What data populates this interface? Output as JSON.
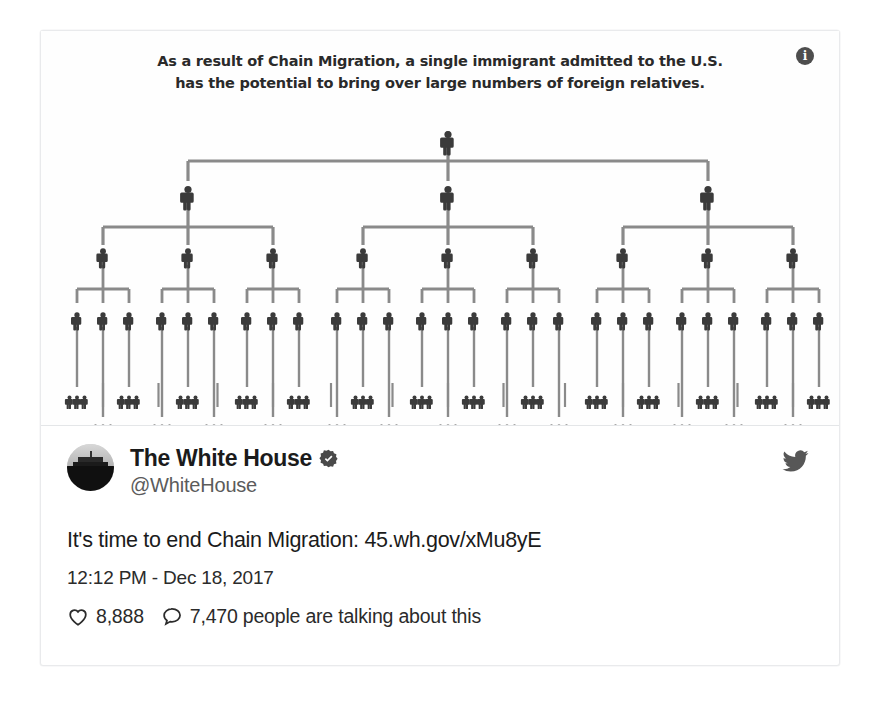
{
  "card": {
    "graphic": {
      "headline_line1": "As a result of Chain Migration, a single immigrant admitted to the U.S.",
      "headline_line2": "has the potential to bring over large numbers of foreign relatives.",
      "info_icon_glyph": "i",
      "figure_color": "#3b3b3b",
      "connector_color": "#8a8a8a",
      "background": "#ffffff",
      "tree": {
        "levels": [
          {
            "name": "root",
            "count": 1
          },
          {
            "name": "children",
            "count": 3
          },
          {
            "name": "grandchildren",
            "count": 9
          },
          {
            "name": "great-grandchildren",
            "count": 27
          },
          {
            "name": "cluster-row-1",
            "count": 42
          },
          {
            "name": "cluster-row-2",
            "count": 42
          }
        ]
      }
    },
    "tweet": {
      "display_name": "The White House",
      "handle": "@WhiteHouse",
      "verified": true,
      "verified_icon": "verified-badge-icon",
      "avatar_icon": "white-house-avatar",
      "brand_icon": "twitter-bird-icon",
      "text": "It's time to end Chain Migration: 45.wh.gov/xMu8yE",
      "timestamp": "12:12 PM - Dec 18, 2017",
      "stats": [
        {
          "icon": "heart-icon",
          "value": "8,888"
        },
        {
          "icon": "reply-icon",
          "value": "7,470 people are talking about this"
        }
      ]
    }
  },
  "colors": {
    "text_primary": "#1b1b1b",
    "text_secondary": "#5b5b5b",
    "border": "#e9eaec",
    "icon_dark": "#4e4e4e"
  }
}
